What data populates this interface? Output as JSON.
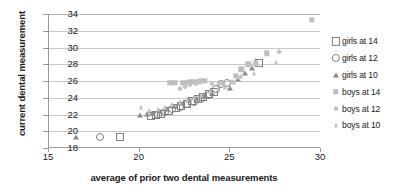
{
  "chart_data": {
    "type": "scatter",
    "title": "",
    "xlabel": "average of prior two dental measurements",
    "ylabel": "current dental measurement",
    "xlim": [
      15,
      30
    ],
    "ylim": [
      18,
      34
    ],
    "xticks": [
      15,
      20,
      25,
      30
    ],
    "yticks": [
      18,
      20,
      22,
      24,
      26,
      28,
      30,
      32,
      34
    ],
    "grid": "horizontal",
    "legend_position": "right",
    "colors": {
      "open_marker_stroke": "#7f7f7f",
      "filled_marker": "#bdbdbd",
      "gridline": "#c9c9c9",
      "axis": "#9a9a9a",
      "text": "#1a1a1a"
    },
    "series": [
      {
        "name": "girls at 14",
        "marker": "square-open",
        "points": [
          [
            18.9,
            19.3
          ],
          [
            20.6,
            21.8
          ],
          [
            20.9,
            21.9
          ],
          [
            21.2,
            22.1
          ],
          [
            21.6,
            22.4
          ],
          [
            22.0,
            22.8
          ],
          [
            22.3,
            23.0
          ],
          [
            22.6,
            23.3
          ],
          [
            22.9,
            23.6
          ],
          [
            23.2,
            23.8
          ],
          [
            23.5,
            24.1
          ],
          [
            23.8,
            24.4
          ],
          [
            24.1,
            24.7
          ],
          [
            26.6,
            28.1
          ]
        ]
      },
      {
        "name": "girls at 12",
        "marker": "circle-open",
        "points": [
          [
            17.8,
            19.3
          ],
          [
            21.0,
            22.0
          ],
          [
            21.4,
            22.3
          ],
          [
            21.8,
            22.6
          ],
          [
            22.2,
            22.9
          ],
          [
            22.6,
            23.2
          ],
          [
            23.0,
            23.5
          ],
          [
            23.4,
            23.9
          ],
          [
            23.8,
            24.3
          ],
          [
            24.2,
            25.1
          ],
          [
            24.5,
            25.6
          ],
          [
            24.8,
            25.8
          ]
        ]
      },
      {
        "name": "girls at 10",
        "marker": "triangle-open",
        "points": [
          [
            16.5,
            19.3
          ],
          [
            20.0,
            22.0
          ],
          [
            20.4,
            22.1
          ],
          [
            20.7,
            22.2
          ],
          [
            21.1,
            22.4
          ],
          [
            21.5,
            22.6
          ],
          [
            21.9,
            23.0
          ],
          [
            22.3,
            23.4
          ],
          [
            22.7,
            23.7
          ],
          [
            23.1,
            24.0
          ],
          [
            23.5,
            24.2
          ],
          [
            23.6,
            24.3
          ],
          [
            24.0,
            24.6
          ],
          [
            25.0,
            25.2
          ],
          [
            25.4,
            26.2
          ],
          [
            25.8,
            27.0
          ],
          [
            26.2,
            27.6
          ]
        ]
      },
      {
        "name": "boys at 14",
        "marker": "square-filled",
        "points": [
          [
            21.7,
            25.8
          ],
          [
            21.9,
            25.8
          ],
          [
            22.4,
            25.8
          ],
          [
            22.6,
            25.8
          ],
          [
            22.8,
            25.9
          ],
          [
            23.0,
            25.9
          ],
          [
            23.2,
            25.9
          ],
          [
            23.4,
            26.0
          ],
          [
            23.6,
            26.0
          ],
          [
            24.6,
            25.8
          ],
          [
            25.3,
            26.6
          ],
          [
            25.6,
            27.4
          ],
          [
            26.0,
            28.0
          ],
          [
            26.4,
            28.1
          ],
          [
            27.0,
            29.3
          ],
          [
            29.5,
            33.3
          ]
        ]
      },
      {
        "name": "boys at 12",
        "marker": "diamond-filled",
        "points": [
          [
            22.2,
            25.1
          ],
          [
            22.5,
            25.3
          ],
          [
            22.8,
            25.5
          ],
          [
            23.1,
            25.7
          ],
          [
            23.4,
            25.9
          ],
          [
            24.0,
            25.6
          ],
          [
            24.4,
            25.7
          ],
          [
            25.1,
            25.9
          ],
          [
            25.5,
            26.4
          ],
          [
            26.1,
            27.9
          ],
          [
            27.7,
            29.5
          ]
        ]
      },
      {
        "name": "boys at 10",
        "marker": "triangle-filled",
        "points": [
          [
            20.1,
            22.9
          ],
          [
            20.5,
            22.5
          ],
          [
            21.0,
            22.6
          ],
          [
            21.4,
            22.9
          ],
          [
            21.8,
            23.2
          ],
          [
            22.2,
            23.5
          ],
          [
            22.6,
            23.8
          ],
          [
            23.0,
            24.1
          ],
          [
            23.4,
            24.3
          ],
          [
            23.9,
            24.8
          ],
          [
            24.3,
            25.0
          ],
          [
            24.7,
            25.3
          ],
          [
            25.2,
            25.9
          ],
          [
            25.6,
            26.6
          ],
          [
            26.3,
            27.0
          ],
          [
            27.5,
            28.3
          ]
        ]
      }
    ]
  }
}
